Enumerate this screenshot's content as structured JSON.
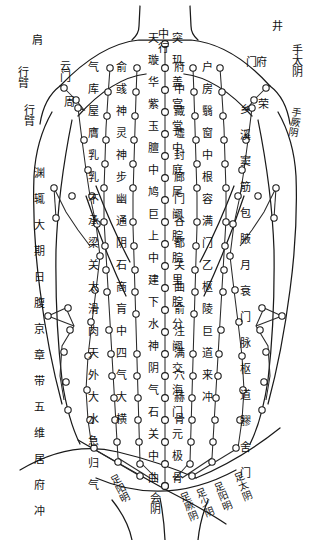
{
  "meta": {
    "subtitle": "Chest and abdomen acupuncture point chart",
    "ink_color": "#1a1a1a",
    "paper_color": "#ffffff"
  },
  "chart_data": {
    "type": "diagram",
    "meridian_labels_top": [
      "肩",
      "行臂",
      "行臂",
      "中行",
      "井",
      "手太阴",
      "手厥阴"
    ],
    "meridian_labels_bottom": [
      "会阴",
      "足阳明",
      "足厥阴",
      "足少阴",
      "足阳明",
      "足太阴"
    ],
    "columns": [
      {
        "name": "ren-meridian-center",
        "side": "center",
        "points": [
          "天突",
          "璇玑",
          "华盖",
          "紫宫",
          "玉堂",
          "膻中",
          "中庭",
          "鸠尾",
          "巨阙",
          "上脘",
          "中脘",
          "建里",
          "下脘",
          "水分",
          "神阙",
          "阴交",
          "气海",
          "石门",
          "关元",
          "中极",
          "曲骨"
        ]
      },
      {
        "name": "kidney-meridian-left",
        "side": "left",
        "points": [
          "俞府",
          "彧中",
          "神藏",
          "灵墟",
          "神封",
          "步廊",
          "幽门",
          "通谷",
          "阴都",
          "石关",
          "商曲",
          "肓俞",
          "中注",
          "四满",
          "气穴",
          "大赫",
          "横骨"
        ]
      },
      {
        "name": "stomach-meridian-left",
        "side": "left",
        "points": [
          "气户",
          "库房",
          "屋翳",
          "膺窗",
          "乳中",
          "乳根",
          "不容",
          "承满",
          "梁门",
          "关门",
          "太乙",
          "滑肉门",
          "天枢",
          "外陵",
          "大巨",
          "水道",
          "归来",
          "气冲"
        ]
      },
      {
        "name": "spleen-meridian-left",
        "side": "left",
        "points": [
          "周荣",
          "胸乡",
          "天溪",
          "食窦",
          "大包",
          "腹哀",
          "大横",
          "腹结",
          "府舍",
          "冲门"
        ]
      },
      {
        "name": "lung-liver-left",
        "side": "left",
        "points": [
          "中府",
          "云门",
          "渊腋",
          "辄筋",
          "期门",
          "日月",
          "章门",
          "京门",
          "带脉",
          "五枢",
          "维道",
          "居髎"
        ]
      },
      {
        "name": "kidney-meridian-right",
        "side": "right",
        "points": [
          "俞府",
          "彧中",
          "神藏",
          "灵墟",
          "神封",
          "步廊",
          "幽门",
          "通谷",
          "阴都",
          "石关",
          "商曲",
          "肓俞",
          "中注",
          "四满",
          "气穴",
          "大赫",
          "横骨"
        ]
      },
      {
        "name": "stomach-meridian-right",
        "side": "right",
        "points": [
          "气户",
          "库房",
          "屋翳",
          "膺窗",
          "乳中",
          "乳根",
          "不容",
          "承满",
          "梁门",
          "关门",
          "太乙",
          "滑肉门",
          "天枢",
          "外陵",
          "大巨",
          "水道",
          "归来",
          "气冲"
        ]
      },
      {
        "name": "spleen-meridian-right",
        "side": "right",
        "points": [
          "周荣",
          "胸乡",
          "天溪",
          "食窦",
          "大包",
          "腹哀",
          "大横",
          "腹结",
          "府舍",
          "冲门"
        ]
      },
      {
        "name": "lung-liver-right",
        "side": "right",
        "points": [
          "中府",
          "云门",
          "渊腋",
          "辄筋",
          "期门",
          "日月",
          "章门",
          "京门",
          "带脉",
          "五枢",
          "维道",
          "居髎"
        ]
      }
    ]
  },
  "labels": {
    "top_left": {
      "shoulder": "肩",
      "arm_upper": "行臂",
      "arm_lower": "行臂",
      "yunmen": "云门",
      "zhongfu_1": "中",
      "zhourong": "周"
    },
    "top_center": {
      "zhong": "中",
      "xing": "行",
      "tiantu_a": "天",
      "tiantu_b": "突",
      "xuanji_a": "璇",
      "xuanji_b": "玑",
      "huagai_a": "华",
      "huagai_b": "盖",
      "zigong_a": "紫",
      "zigong_b": "宫",
      "yutang_a": "玉",
      "yutang_b": "堂",
      "danzhong_a": "膻",
      "danzhong_b": "中",
      "zhongting_a": "中",
      "zhongting_b": "庭",
      "jiuwei_a": "鸠",
      "jiuwei_b": "尾"
    },
    "top_right": {
      "jing": "井",
      "shou_taiyin": "手太阴",
      "shou_jueyin": "手厥阴",
      "menfu_a": "门",
      "menfu_b": "府",
      "rong": "荣"
    },
    "left_column_1": [
      "气",
      "库",
      "屋",
      "膺",
      "乳",
      "乳",
      "不",
      "承",
      "梁",
      "关",
      "太",
      "滑",
      "肉",
      "天",
      "外",
      "大",
      "水",
      "急",
      "归",
      "气"
    ],
    "left_column_2": [
      "俞",
      "彧",
      "神",
      "灵",
      "神",
      "步",
      "幽",
      "通",
      "阴",
      "石",
      "商",
      "肓",
      "中",
      "四",
      "气",
      "大",
      "横"
    ],
    "left_outer": [
      "渊",
      "辄",
      "大",
      "期",
      "日",
      "腹",
      "京",
      "章",
      "带",
      "五",
      "维",
      "居",
      "府",
      "冲"
    ],
    "right_column_1": [
      "户",
      "房",
      "翳",
      "窗",
      "中",
      "根",
      "容",
      "满",
      "门",
      "乙",
      "枢",
      "陵",
      "巨",
      "道",
      "来",
      "冲"
    ],
    "right_column_2": [
      "府",
      "中",
      "藏",
      "墟",
      "封",
      "廊",
      "门",
      "谷",
      "都",
      "关",
      "曲",
      "俞",
      "注",
      "满",
      "穴",
      "赫",
      "骨"
    ],
    "right_outer": [
      "乡",
      "溪",
      "窦",
      "筋",
      "包",
      "腋",
      "月",
      "衰",
      "门",
      "脉",
      "枢",
      "道",
      "髎",
      "舍",
      "门"
    ],
    "bottom": {
      "huiyin": "会阴",
      "zu_yangming_1": "足阳明",
      "zu_jueyin": "足厥阴",
      "zu_shaoyin": "足少阴",
      "zu_yangming_2": "足阳明",
      "zu_taiyin": "足太阴"
    }
  },
  "legend": {
    "point_marker": "open-circle",
    "line_style": "solid-thin"
  }
}
